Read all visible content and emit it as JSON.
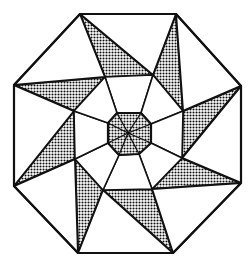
{
  "figure": {
    "title": "",
    "colors": {
      "background": "#ffffff",
      "stroke": "#111111",
      "shade_fill": "#bdbdbd",
      "shade_dot": "#111111"
    },
    "center": [
      128,
      133
    ],
    "outer_octagon": [
      [
        80,
        14
      ],
      [
        176,
        14
      ],
      [
        241,
        86
      ],
      [
        241,
        183
      ],
      [
        173,
        253
      ],
      [
        78,
        253
      ],
      [
        14,
        186
      ],
      [
        14,
        85
      ]
    ],
    "middle_octagon": [
      [
        105,
        77
      ],
      [
        153,
        75
      ],
      [
        183,
        111
      ],
      [
        182,
        158
      ],
      [
        152,
        189
      ],
      [
        103,
        190
      ],
      [
        75,
        159
      ],
      [
        74,
        111
      ]
    ],
    "inner_octagon": [
      [
        117,
        113
      ],
      [
        141,
        113
      ],
      [
        151,
        124
      ],
      [
        151,
        143
      ],
      [
        139,
        154
      ],
      [
        119,
        155
      ],
      [
        108,
        143
      ],
      [
        108,
        123
      ]
    ]
  }
}
